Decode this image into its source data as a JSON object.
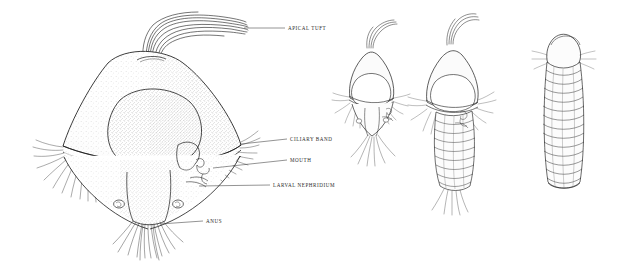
{
  "figure": {
    "kind": "scientific-line-illustration",
    "background_color": "#ffffff",
    "ink_color": "#1a1a1a",
    "label_color": "#2b2b2b"
  },
  "labels": [
    {
      "id": "apical-tuft",
      "text": "APICAL TUFT"
    },
    {
      "id": "ciliary-band",
      "text": "CILIARY BAND"
    },
    {
      "id": "mouth",
      "text": "MOUTH"
    },
    {
      "id": "larval-nephridium",
      "text": "LARVAL NEPHRIDIUM"
    },
    {
      "id": "anus",
      "text": "ANUS"
    }
  ],
  "stages": [
    {
      "id": "stage-1-trochophore",
      "order": 1
    },
    {
      "id": "stage-2-early-metatrochophore",
      "order": 2
    },
    {
      "id": "stage-3-metatrochophore",
      "order": 3
    },
    {
      "id": "stage-4-nectochaete",
      "order": 4
    },
    {
      "id": "stage-5-juvenile-worm",
      "order": 5
    }
  ]
}
